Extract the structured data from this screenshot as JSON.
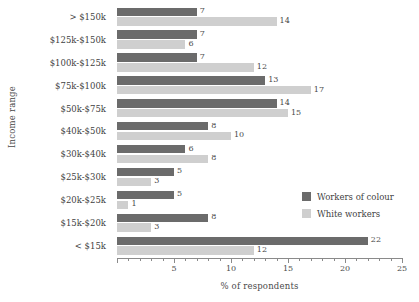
{
  "chart_data": {
    "type": "bar",
    "orientation": "horizontal",
    "title": "",
    "xlabel": "% of respondents",
    "ylabel": "Income range",
    "xlim": [
      0,
      25
    ],
    "xticks": [
      0,
      5,
      10,
      15,
      20,
      25
    ],
    "xticklabels": [
      "0",
      "5",
      "10",
      "15",
      "20",
      "25"
    ],
    "minor_tick_step": 1,
    "grid": false,
    "legend_position": "center right",
    "categories": [
      "> $150k",
      "$125k-$150k",
      "$100k-$125k",
      "$75k-$100k",
      "$50k-$75k",
      "$40k-$50k",
      "$30k-$40k",
      "$25k-$30k",
      "$20k-$25k",
      "$15k-$20k",
      "< $15k"
    ],
    "series": [
      {
        "name": "Workers of colour",
        "color": "#6b6b6b",
        "values": [
          7,
          7,
          7,
          13,
          14,
          8,
          6,
          5,
          5,
          8,
          22
        ]
      },
      {
        "name": "White workers",
        "color": "#cfcfcf",
        "values": [
          14,
          6,
          12,
          17,
          15,
          10,
          8,
          3,
          1,
          3,
          12
        ]
      }
    ]
  },
  "legend": {
    "entries": [
      {
        "label": "Workers of colour",
        "color": "#6b6b6b"
      },
      {
        "label": "White workers",
        "color": "#cfcfcf"
      }
    ]
  }
}
